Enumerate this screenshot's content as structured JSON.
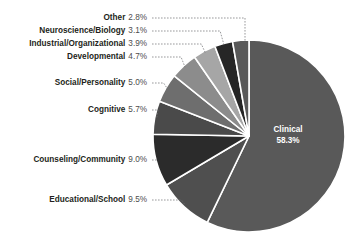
{
  "chart_data": {
    "type": "pie",
    "title": "",
    "subtitle": "",
    "xlabel": "",
    "ylabel": "",
    "legend_position": "none",
    "grid": false,
    "label_format": "name percent",
    "start_angle_deg": 0,
    "direction": "clockwise",
    "units": "percent",
    "total": 100.0,
    "categories": [
      "Clinical",
      "Educational/School",
      "Counseling/Community",
      "Cognitive",
      "Social/Personality",
      "Developmental",
      "Industrial/Organizational",
      "Neuroscience/Biology",
      "Other"
    ],
    "values": [
      58.3,
      9.5,
      9.0,
      5.7,
      5.0,
      4.7,
      3.9,
      3.1,
      2.8
    ],
    "slices": [
      {
        "name": "Clinical",
        "value": 58.3,
        "percent_label": "58.3%",
        "color": "#595959",
        "label_placement": "inside"
      },
      {
        "name": "Educational/School",
        "value": 9.5,
        "percent_label": "9.5%",
        "color": "#4f4f4f",
        "label_placement": "outside"
      },
      {
        "name": "Counseling/Community",
        "value": 9.0,
        "percent_label": "9.0%",
        "color": "#2b2b2b",
        "label_placement": "outside"
      },
      {
        "name": "Cognitive",
        "value": 5.7,
        "percent_label": "5.7%",
        "color": "#4a4a4a",
        "label_placement": "outside"
      },
      {
        "name": "Social/Personality",
        "value": 5.0,
        "percent_label": "5.0%",
        "color": "#6e6e6e",
        "label_placement": "outside"
      },
      {
        "name": "Developmental",
        "value": 4.7,
        "percent_label": "4.7%",
        "color": "#8c8c8c",
        "label_placement": "outside"
      },
      {
        "name": "Industrial/Organizational",
        "value": 3.9,
        "percent_label": "3.9%",
        "color": "#a6a6a6",
        "label_placement": "outside"
      },
      {
        "name": "Neuroscience/Biology",
        "value": 3.1,
        "percent_label": "3.1%",
        "color": "#262626",
        "label_placement": "outside"
      },
      {
        "name": "Other",
        "value": 2.8,
        "percent_label": "2.8%",
        "color": "#595959",
        "label_placement": "outside"
      }
    ]
  },
  "style": {
    "background": "#ffffff",
    "slice_border": "#ffffff",
    "leader_line": "#6d6e71",
    "label_name_color": "#231f20",
    "label_pct_color": "#4d4d4d",
    "inside_label_color": "#ffffff"
  },
  "geometry": {
    "cx": 249,
    "cy": 136,
    "r": 96,
    "label_x": 147,
    "label_rows_y": [
      18,
      31,
      44,
      57,
      83,
      110,
      160,
      200
    ],
    "inside_label": {
      "x": 288,
      "y": 130
    }
  }
}
